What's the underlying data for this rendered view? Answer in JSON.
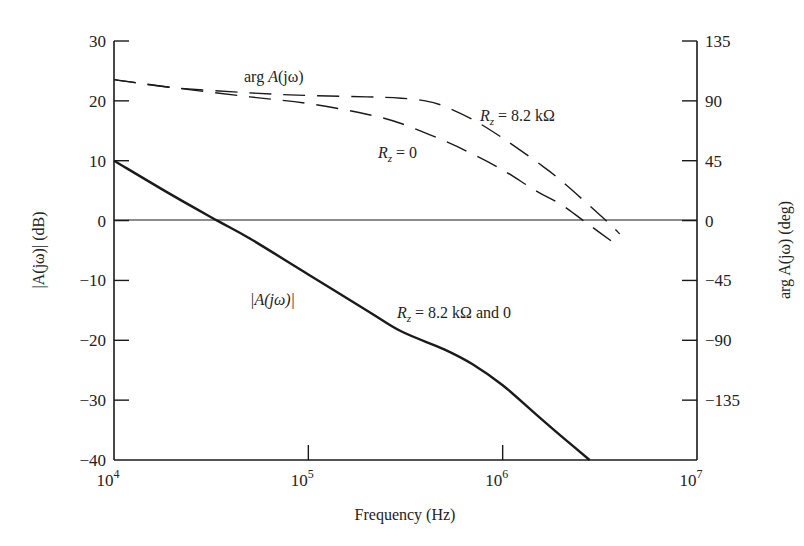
{
  "chart_data": {
    "type": "line",
    "title": "",
    "xlabel": "Frequency (Hz)",
    "ylabel": "|A(jω)| (dB)",
    "y2label": "arg A(jω) (deg)",
    "xscale": "log",
    "xlim": [
      10000,
      10000000
    ],
    "ylim": [
      -40,
      30
    ],
    "y2lim": [
      -180,
      135
    ],
    "grid": false,
    "x_ticks": [
      {
        "value": 10000,
        "base": "10",
        "exp": "4"
      },
      {
        "value": 100000,
        "base": "10",
        "exp": "5"
      },
      {
        "value": 1000000,
        "base": "10",
        "exp": "6"
      },
      {
        "value": 10000000,
        "base": "10",
        "exp": "7"
      }
    ],
    "y_ticks": [
      "30",
      "20",
      "10",
      "0",
      "−10",
      "−20",
      "−30",
      "−40"
    ],
    "y_tick_values": [
      30,
      20,
      10,
      0,
      -10,
      -20,
      -30,
      -40
    ],
    "y2_ticks": [
      "135",
      "90",
      "45",
      "0",
      "−45",
      "−90",
      "−135"
    ],
    "y2_tick_values": [
      135,
      90,
      45,
      0,
      -45,
      -90,
      -135
    ],
    "series": [
      {
        "name": "|A(jω)|",
        "axis": "left",
        "style": "solid",
        "label": "R_z = 8.2 kΩ and 0",
        "x": [
          10000,
          20000,
          34000,
          50000,
          100000,
          200000,
          300000,
          500000,
          700000,
          1000000,
          1500000,
          2000000,
          2800000
        ],
        "y": [
          10,
          4.2,
          0,
          -3,
          -9,
          -15,
          -18.5,
          -21.5,
          -24,
          -27.5,
          -32.5,
          -36,
          -40
        ]
      },
      {
        "name": "arg A(jω), R_z = 8.2 kΩ",
        "axis": "right",
        "style": "dashed",
        "x": [
          10000,
          20000,
          50000,
          100000,
          200000,
          300000,
          400000,
          500000,
          700000,
          1000000,
          1500000,
          2000000,
          3400000,
          4000000
        ],
        "y": [
          106,
          100,
          96,
          94,
          93,
          92,
          90,
          86,
          76,
          62,
          44,
          30,
          0,
          -10
        ]
      },
      {
        "name": "arg A(jω), R_z = 0",
        "axis": "right",
        "style": "dashed",
        "x": [
          10000,
          20000,
          50000,
          100000,
          200000,
          300000,
          500000,
          700000,
          1000000,
          1500000,
          2000000,
          2600000,
          4000000
        ],
        "y": [
          106,
          100,
          93,
          88,
          80,
          73,
          60,
          50,
          38,
          22,
          12,
          0,
          -20
        ]
      }
    ],
    "annotations": [
      {
        "text": "arg A(jω)",
        "near": "phase curves top"
      },
      {
        "text": "R_z = 8.2 kΩ",
        "near": "upper phase curve"
      },
      {
        "text": "R_z = 0",
        "near": "lower phase curve"
      },
      {
        "text": "|A(jω)|",
        "near": "magnitude curve"
      },
      {
        "text": "R_z = 8.2 kΩ and 0",
        "near": "magnitude curve"
      }
    ]
  },
  "labels": {
    "xlabel": "Frequency (Hz)",
    "ylabel": "|A(jω)| (dB)",
    "y2label": "arg A(jω) (deg)",
    "arg_label_pre": "arg ",
    "arg_label_A": "A",
    "arg_label_post": "(jω)",
    "rz82_R": "R",
    "rz82_sub": "z",
    "rz82_rest": " = 8.2 kΩ",
    "rz0_R": "R",
    "rz0_sub": "z",
    "rz0_rest": " = 0",
    "mag_label": "|A(jω)|",
    "mag_rz_R": "R",
    "mag_rz_sub": "z",
    "mag_rz_rest": " = 8.2 kΩ and 0"
  },
  "colors": {
    "ink": "#1a1a1a",
    "background": "#ffffff"
  }
}
